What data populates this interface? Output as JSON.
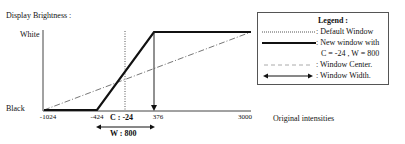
{
  "diagram": {
    "y_axis_title": "Display Brightness :",
    "y_top_label": "White",
    "y_bottom_label": "Black",
    "x_axis_title": "Original intensities",
    "x_ticks": [
      "-1024",
      "-424",
      "376",
      "3000"
    ],
    "center_label": "C : -24",
    "width_label": "W : 800"
  },
  "legend": {
    "title": "Legend :",
    "items": [
      {
        "style": "dotted",
        "label": ": Default Window"
      },
      {
        "style": "thick-solid",
        "label": ": New window with"
      },
      {
        "style": "none",
        "label": "C = -24   , W = 800"
      },
      {
        "style": "dash-dot",
        "label": ": Window Center."
      },
      {
        "style": "double-arrow",
        "label": ": Window Width."
      }
    ]
  },
  "colors": {
    "line": "#111111",
    "dashdot": "#777777",
    "axis": "#444444"
  }
}
